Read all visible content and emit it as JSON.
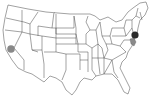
{
  "map": {
    "region": "United States (contiguous)",
    "markers": [
      {
        "name": "California",
        "x": 11,
        "y": 49,
        "r": 3.8,
        "color": "#888888"
      },
      {
        "name": "New Jersey",
        "x": 135,
        "y": 35,
        "r": 3.6,
        "color": "#2a2a2a"
      }
    ],
    "highlighted_regions": [
      {
        "name": "Delaware / Maryland",
        "color": "#8a8a8a"
      }
    ],
    "colors": {
      "background": "#ffffff",
      "border": "#444444",
      "land": "#ffffff"
    }
  }
}
